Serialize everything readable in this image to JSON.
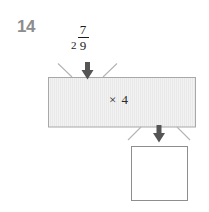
{
  "problem": {
    "number": "14",
    "type": "function-machine"
  },
  "input": {
    "whole": "2",
    "numerator": "7",
    "denominator": "9",
    "label": "2 7/9"
  },
  "machine": {
    "operation_symbol": "×",
    "operation_value": "4",
    "operation_label": "× 4"
  },
  "output": {
    "answer": "",
    "placeholder": ""
  },
  "colors": {
    "machine_fill": "#f1f1f1",
    "machine_stroke": "#a8a8a8",
    "funnel_stroke": "#b4b4b4",
    "arrow_fill": "#555555",
    "answer_box_fill": "#ffffff",
    "answer_box_stroke": "#8e8e8e",
    "number_color": "#8d8d8d",
    "text_color": "#1c1c1c"
  }
}
